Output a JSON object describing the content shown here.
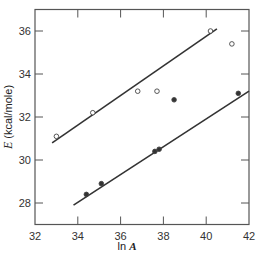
{
  "chart_data": {
    "type": "scatter",
    "title": "",
    "xlabel": "ln A",
    "ylabel": "E (kcal/mole)",
    "xlim": [
      32,
      42
    ],
    "ylim": [
      27,
      37
    ],
    "xticks": [
      32,
      34,
      36,
      38,
      40,
      42
    ],
    "yticks": [
      28,
      30,
      32,
      34,
      36
    ],
    "grid": false,
    "series": [
      {
        "name": "open circles",
        "marker": "open-circle",
        "points": [
          {
            "x": 33.0,
            "y": 31.1
          },
          {
            "x": 34.7,
            "y": 32.2
          },
          {
            "x": 36.8,
            "y": 33.2
          },
          {
            "x": 37.7,
            "y": 33.2
          },
          {
            "x": 40.2,
            "y": 36.0
          },
          {
            "x": 41.2,
            "y": 35.4
          }
        ],
        "fit_line": {
          "x": [
            32.8,
            40.5
          ],
          "y": [
            30.8,
            36.1
          ]
        }
      },
      {
        "name": "filled circles",
        "marker": "filled-circle",
        "points": [
          {
            "x": 34.4,
            "y": 28.4
          },
          {
            "x": 35.1,
            "y": 28.9
          },
          {
            "x": 37.6,
            "y": 30.4
          },
          {
            "x": 37.8,
            "y": 30.5
          },
          {
            "x": 38.5,
            "y": 32.8
          },
          {
            "x": 41.5,
            "y": 33.1
          }
        ],
        "fit_line": {
          "x": [
            33.8,
            42.0
          ],
          "y": [
            27.9,
            33.2
          ]
        }
      }
    ]
  },
  "labels": {
    "ylabel_symbol": "E",
    "ylabel_units": " (kcal/mole)",
    "xlabel_prefix": "ln ",
    "xlabel_symbol": "A"
  }
}
